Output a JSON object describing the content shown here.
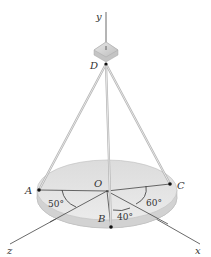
{
  "figure": {
    "type": "3D statics diagram",
    "axes": {
      "x": "x",
      "y": "y",
      "z": "z"
    },
    "points": {
      "D": "D",
      "O": "O",
      "A": "A",
      "B": "B",
      "C": "C"
    },
    "angles": {
      "AOz": "50°",
      "BOx": "40°",
      "COx": "60°"
    },
    "colors": {
      "disk_top": "#e2e2e2",
      "disk_edge": "#c8c8c8",
      "cable": "#b8b8b8",
      "line": "#444444",
      "point": "#111111"
    }
  }
}
